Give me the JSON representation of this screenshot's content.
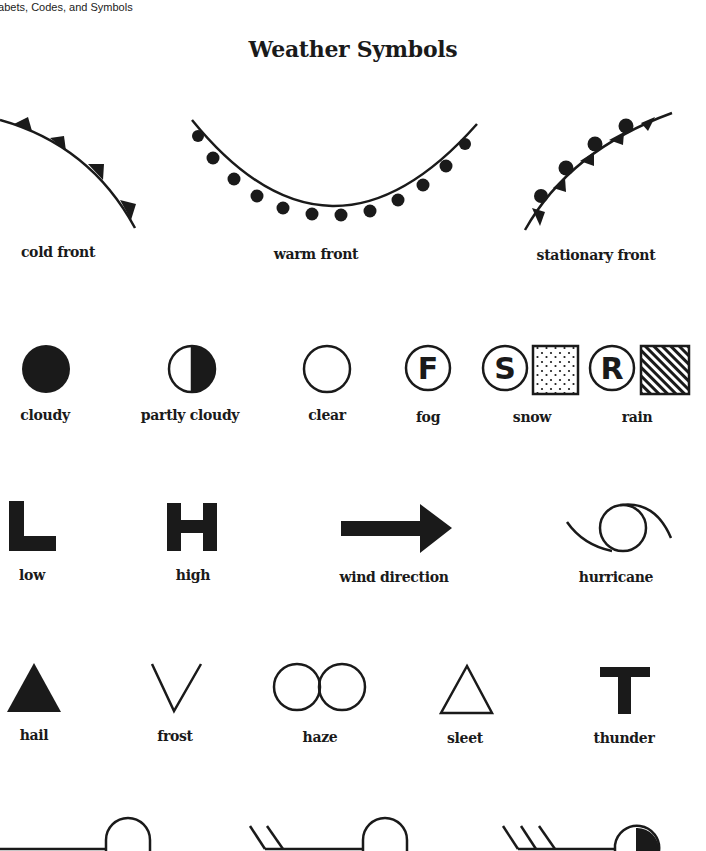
{
  "page": {
    "running_header": "habets, Codes, and Symbols",
    "title": "Weather Symbols"
  },
  "fronts": [
    {
      "id": "cold-front",
      "label": "cold front",
      "icon": "cold-front-icon"
    },
    {
      "id": "warm-front",
      "label": "warm front",
      "icon": "warm-front-icon"
    },
    {
      "id": "stationary-front",
      "label": "stationary front",
      "icon": "stationary-front-icon"
    }
  ],
  "sky": [
    {
      "id": "cloudy",
      "label": "cloudy",
      "icon": "filled-circle-icon"
    },
    {
      "id": "partly-cloudy",
      "label": "partly cloudy",
      "icon": "half-filled-circle-icon"
    },
    {
      "id": "clear",
      "label": "clear",
      "icon": "empty-circle-icon"
    },
    {
      "id": "fog",
      "label": "fog",
      "icon": "circled-f-icon",
      "letter": "F"
    },
    {
      "id": "snow",
      "label": "snow",
      "icon": "circled-s-dotted-square-icon",
      "letter": "S"
    },
    {
      "id": "rain",
      "label": "rain",
      "icon": "circled-r-hatched-square-icon",
      "letter": "R"
    }
  ],
  "pressure": [
    {
      "id": "low",
      "label": "low",
      "icon": "letter-l-icon",
      "letter": "L"
    },
    {
      "id": "high",
      "label": "high",
      "icon": "letter-h-icon",
      "letter": "H"
    },
    {
      "id": "wind-direction",
      "label": "wind direction",
      "icon": "arrow-right-icon"
    },
    {
      "id": "hurricane",
      "label": "hurricane",
      "icon": "hurricane-icon"
    }
  ],
  "precip": [
    {
      "id": "hail",
      "label": "hail",
      "icon": "filled-triangle-icon"
    },
    {
      "id": "frost",
      "label": "frost",
      "icon": "v-shape-icon"
    },
    {
      "id": "haze",
      "label": "haze",
      "icon": "double-circle-icon"
    },
    {
      "id": "sleet",
      "label": "sleet",
      "icon": "outline-triangle-icon"
    },
    {
      "id": "thunder",
      "label": "thunder",
      "icon": "letter-t-icon",
      "letter": "T"
    }
  ],
  "wind_barbs": [
    {
      "id": "barb-calm",
      "icon": "wind-barb-no-feathers-icon"
    },
    {
      "id": "barb-two",
      "icon": "wind-barb-two-feathers-icon"
    },
    {
      "id": "barb-three",
      "icon": "wind-barb-three-feathers-partly-cloudy-icon"
    }
  ],
  "colors": {
    "ink": "#1a1a1a",
    "paper": "#ffffff"
  }
}
